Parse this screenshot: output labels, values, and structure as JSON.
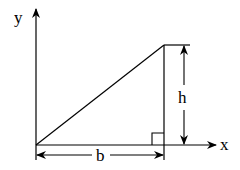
{
  "diagram": {
    "type": "right-triangle-on-axes",
    "labels": {
      "y_axis": "y",
      "x_axis": "x",
      "height": "h",
      "base": "b"
    },
    "colors": {
      "stroke": "#000000",
      "background": "#ffffff"
    },
    "features": [
      "y-axis-arrow",
      "x-axis-arrow",
      "hypotenuse",
      "vertical-leg",
      "right-angle-marker",
      "height-dimension",
      "base-dimension"
    ]
  }
}
